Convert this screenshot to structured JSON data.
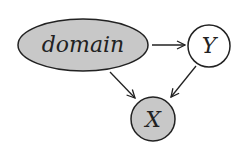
{
  "diagram": {
    "nodes": [
      {
        "id": "domain",
        "label": "domain",
        "shape": "ellipse",
        "fill": "#c8c8c8",
        "observed": true
      },
      {
        "id": "Y",
        "label": "Y",
        "shape": "circle",
        "fill": "#ffffff",
        "observed": false
      },
      {
        "id": "X",
        "label": "X",
        "shape": "circle",
        "fill": "#c8c8c8",
        "observed": true
      }
    ],
    "edges": [
      {
        "from": "domain",
        "to": "Y"
      },
      {
        "from": "domain",
        "to": "X"
      },
      {
        "from": "Y",
        "to": "X"
      }
    ]
  }
}
